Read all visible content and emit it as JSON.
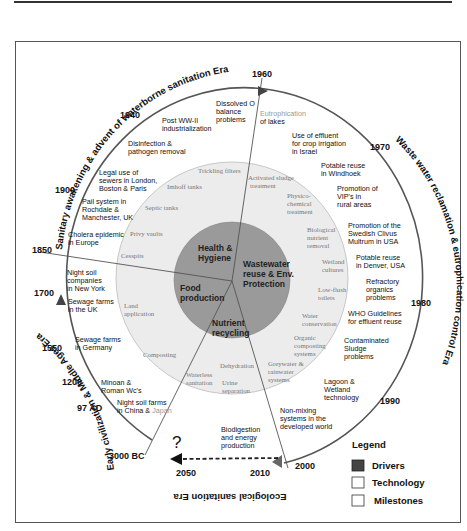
{
  "eras": {
    "top_left": "Sanitary awakening & advent of waterborne sanitation Era",
    "right": "Waste water reclamation & eutrophication control Era",
    "bottom": "Ecological sanitation Era",
    "left": "Early civilization & Middle Ages Era"
  },
  "years": {
    "y1960": "1960",
    "y1940": "1940",
    "y1900": "1900",
    "y1850": "1850",
    "y1700": "1700",
    "y1550": "1550",
    "y1200": "1200",
    "y97ad": "97 AD",
    "y3000bc": "3000 BC",
    "y2050": "2050",
    "y2010": "2010",
    "y2000": "2000",
    "y1990": "1990",
    "y1980": "1980",
    "y1970": "1970"
  },
  "milestones": {
    "dissolved": [
      "Dissolved O",
      "balance",
      "problems"
    ],
    "eutro_a": "Eutrophication",
    "eutro_b": "of lakes",
    "postww": [
      "Post WW-II",
      "industrialization"
    ],
    "disinfect": [
      "Disinfection &",
      "pathogen removal"
    ],
    "legal": [
      "Legal use of",
      "sewers in London,",
      "Boston & Paris"
    ],
    "pail": [
      "Pail system in",
      "Rochdale &",
      "Manchester, UK"
    ],
    "cholera": [
      "Cholera epidemic",
      "in Europe"
    ],
    "nightsoil_ny": [
      "Night soil",
      "companies",
      "in New York"
    ],
    "sewage_uk": [
      "Sewage farms",
      "in the UK"
    ],
    "sewage_de": [
      "Sewage farms",
      "in Germany"
    ],
    "minoan": [
      "Minoan &",
      "Roman Wc's"
    ],
    "nightsoil_cn_a": "Night soil farms",
    "nightsoil_cn_b": "in China & ",
    "nightsoil_cn_c": "Japan",
    "effluent": [
      "Use of effluent",
      "for crop irrigation",
      "in Israel"
    ],
    "windhoek": [
      "Potable reuse",
      "in Windhoek"
    ],
    "vip": [
      "Promotion of",
      "VIP's in",
      "rural areas"
    ],
    "clivus": [
      "Promotion of the",
      "Swedish Clivus",
      "Multrum in USA"
    ],
    "denver": [
      "Potable reuse",
      "in Denver, USA"
    ],
    "refractory": [
      "Refractory",
      "organics",
      "problems"
    ],
    "who": [
      "WHO Guidelines",
      "for effluent reuse"
    ],
    "sludge": [
      "Contaminated",
      "Sludge",
      "problems"
    ],
    "lagoon": [
      "Lagoon &",
      "Wetland",
      "technology"
    ],
    "nonmixing": [
      "Non-mixing",
      "systems in the",
      "developed world"
    ],
    "biodigestion": [
      "Biodigestion",
      "and energy",
      "production"
    ],
    "question": "?"
  },
  "technology": {
    "trickling": "Trickling filters",
    "imhoff": "Imhoff tanks",
    "septic": "Septic tanks",
    "privy": "Privy vaults",
    "cesspits": "Cesspits",
    "land": [
      "Land",
      "application"
    ],
    "composting": "Composting",
    "waterless": [
      "Waterless",
      "sanitation"
    ],
    "dehydration": "Dehydration",
    "urine": [
      "Urine",
      "separation"
    ],
    "greywater": [
      "Greywater &",
      "rainwater",
      "systems"
    ],
    "organic": [
      "Organic",
      "composting",
      "systems"
    ],
    "water_cons": [
      "Water",
      "conservation"
    ],
    "lowflush": [
      "Low-flush",
      "toilets"
    ],
    "wetland": [
      "Wetland",
      "cultures"
    ],
    "bnr": [
      "Biological",
      "nutrient",
      "removal"
    ],
    "physico": [
      "Physico-",
      "chemical",
      "treatment"
    ],
    "activated": [
      "Activated sludge",
      "treatment"
    ]
  },
  "drivers": {
    "health": [
      "Health &",
      "Hygiene"
    ],
    "wastewater": [
      "Wastewater",
      "reuse & Env.",
      "Protection"
    ],
    "food": [
      "Food",
      "production"
    ],
    "nutrient": [
      "Nutrient",
      "recycling"
    ]
  },
  "legend": {
    "title": "Legend",
    "items": [
      {
        "label": "Drivers",
        "swatch": "#444444"
      },
      {
        "label": "Technology",
        "swatch": "#ffffff"
      },
      {
        "label": "Milestones",
        "swatch": "#ffffff"
      }
    ]
  },
  "colors": {
    "driver_fill": "#9a9a9a",
    "technology_fill": "#ececec",
    "line": "#555555"
  }
}
